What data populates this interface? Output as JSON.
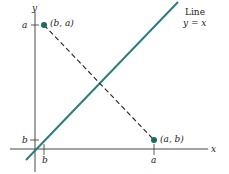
{
  "diagram": {
    "axes": {
      "x_label": "x",
      "y_label": "y"
    },
    "line": {
      "label_line1": "Line",
      "label_line2": "y = x",
      "color": "#2e7d78"
    },
    "points": [
      {
        "label": "(b, a)",
        "color": "#1f6b5e"
      },
      {
        "label": "(a, b)",
        "color": "#1f6b5e"
      }
    ],
    "ticks": {
      "y_axis": [
        "a",
        "b"
      ],
      "x_axis": [
        "b",
        "a"
      ]
    },
    "segment": {
      "style": "dashed",
      "color": "#222222"
    }
  }
}
